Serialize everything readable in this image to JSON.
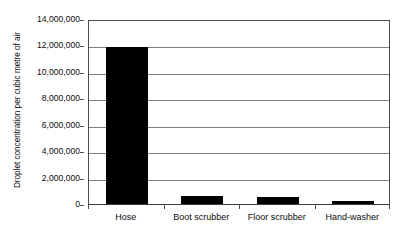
{
  "chart_data": {
    "type": "bar",
    "title": "",
    "subtitle": "",
    "xlabel": "",
    "ylabel": "Droplet concentration per cubic metre of air",
    "categories": [
      "Hose",
      "Boot scrubber",
      "Floor scrubber",
      "Hand-washer"
    ],
    "values": [
      11900000,
      600000,
      500000,
      250000
    ],
    "series": [
      {
        "name": "Droplet concentration",
        "values": [
          11900000,
          600000,
          500000,
          250000
        ]
      }
    ],
    "ylim": [
      0,
      14000000
    ],
    "ytick_values": [
      0,
      2000000,
      4000000,
      6000000,
      8000000,
      10000000,
      12000000,
      14000000
    ],
    "ytick_labels": [
      "14,000,000",
      "12,000,000",
      "10,000,000",
      "8,000,000",
      "6,000,000",
      "4,000,000",
      "2,000,000",
      "0"
    ],
    "grid": true,
    "grid_axis": "y",
    "legend": false,
    "legend_position": "none",
    "bar_color": "#000000",
    "gridline_color": "#7d7d82",
    "axis_color": "#4d4d52",
    "background_color": "#ffffff",
    "annotations": []
  }
}
